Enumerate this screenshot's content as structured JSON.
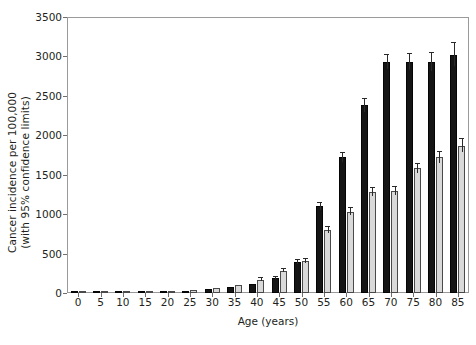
{
  "chart_data": {
    "type": "bar",
    "title": "",
    "xlabel": "Age (years)",
    "ylabel": "Cancer incidence per 100,000 (with 95% confidence limits)",
    "ylabel_line1": "Cancer incidence per 100,000",
    "ylabel_line2": "(with 95% confidence limits)",
    "ylim": [
      0,
      3500
    ],
    "yticks": [
      0,
      500,
      1000,
      1500,
      2000,
      2500,
      3000,
      3500
    ],
    "ytick_labels": [
      "0",
      "500",
      "1000",
      "1500",
      "2000",
      "2500",
      "3000",
      "3500"
    ],
    "grid": false,
    "legend": "none",
    "categories": [
      "0",
      "5",
      "10",
      "15",
      "20",
      "25",
      "30",
      "35",
      "40",
      "45",
      "50",
      "55",
      "60",
      "65",
      "70",
      "75",
      "80",
      "85"
    ],
    "series": [
      {
        "name": "dark-series",
        "color": "#151515",
        "values": [
          20,
          12,
          10,
          12,
          18,
          25,
          45,
          70,
          110,
          190,
          390,
          1100,
          1720,
          2380,
          2930,
          2930,
          2930,
          3020
        ],
        "err_low": [
          14,
          8,
          7,
          8,
          13,
          19,
          37,
          60,
          98,
          174,
          366,
          1058,
          1663,
          2300,
          2836,
          2830,
          2810,
          2875
        ],
        "err_high": [
          26,
          16,
          13,
          16,
          23,
          31,
          53,
          80,
          122,
          206,
          414,
          1142,
          1777,
          2460,
          3024,
          3030,
          3050,
          3165
        ]
      },
      {
        "name": "light-series",
        "color": "#d9d9d9",
        "values": [
          15,
          10,
          8,
          10,
          20,
          35,
          60,
          100,
          170,
          280,
          410,
          800,
          1030,
          1280,
          1290,
          1580,
          1720,
          1870
        ],
        "err_low": [
          10,
          6,
          5,
          6,
          15,
          28,
          51,
          88,
          155,
          261,
          385,
          765,
          986,
          1227,
          1237,
          1519,
          1654,
          1786
        ],
        "err_high": [
          20,
          14,
          11,
          14,
          25,
          42,
          69,
          112,
          185,
          299,
          435,
          835,
          1074,
          1333,
          1343,
          1641,
          1786,
          1954
        ]
      }
    ],
    "axis_color": "#9a9a9a",
    "tick_color": "#6f6f6f",
    "text_color": "#231f20",
    "background": "#ffffff"
  }
}
